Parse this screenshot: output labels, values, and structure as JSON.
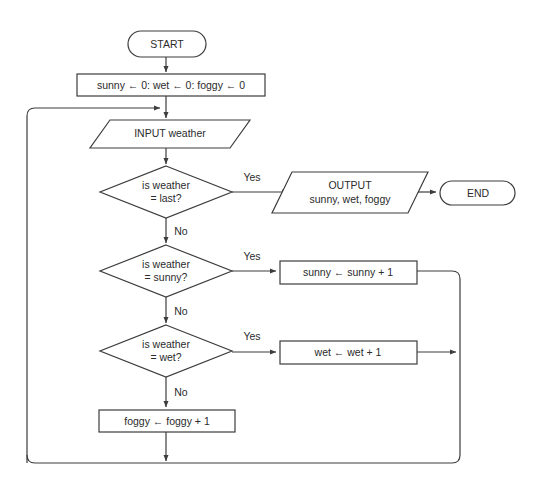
{
  "diagram": {
    "type": "flowchart",
    "colors": {
      "background": "#ffffff",
      "stroke": "#3d3d3d",
      "text": "#2b2b2b",
      "node_fill": "#ffffff"
    },
    "nodes": [
      {
        "id": "start",
        "shape": "terminator",
        "label": "START",
        "x": 128,
        "y": 31,
        "w": 78,
        "h": 26
      },
      {
        "id": "init",
        "shape": "process",
        "label": "sunny ← 0: wet ← 0: foggy ← 0",
        "x": 77,
        "y": 74,
        "w": 188,
        "h": 22
      },
      {
        "id": "input-weather",
        "shape": "parallelogram",
        "label": "INPUT weather",
        "x": 90,
        "y": 120,
        "w": 160,
        "h": 28
      },
      {
        "id": "decision-last",
        "shape": "decision",
        "label_line1": "is weather",
        "label_line2": "= last?",
        "x": 100,
        "y": 166,
        "w": 132,
        "h": 52
      },
      {
        "id": "output-counts",
        "shape": "parallelogram",
        "label_line1": "OUTPUT",
        "label_line2": "sunny, wet, foggy",
        "x": 272,
        "y": 172,
        "w": 156,
        "h": 41
      },
      {
        "id": "end",
        "shape": "terminator",
        "label": "END",
        "x": 440,
        "y": 181,
        "w": 75,
        "h": 24
      },
      {
        "id": "decision-sunny",
        "shape": "decision",
        "label_line1": "is weather",
        "label_line2": "= sunny?",
        "x": 100,
        "y": 245,
        "w": 132,
        "h": 52
      },
      {
        "id": "increment-sunny",
        "shape": "process",
        "label": "sunny ← sunny + 1",
        "x": 280,
        "y": 261,
        "w": 137,
        "h": 23
      },
      {
        "id": "decision-wet",
        "shape": "decision",
        "label_line1": "is weather",
        "label_line2": "= wet?",
        "x": 100,
        "y": 325,
        "w": 132,
        "h": 52
      },
      {
        "id": "increment-wet",
        "shape": "process",
        "label": "wet ← wet + 1",
        "x": 280,
        "y": 341,
        "w": 137,
        "h": 23
      },
      {
        "id": "increment-foggy",
        "shape": "process",
        "label": "foggy ← foggy + 1",
        "x": 99,
        "y": 410,
        "w": 136,
        "h": 22
      }
    ],
    "edge_labels": [
      {
        "id": "yes-last",
        "text": "Yes",
        "x": 252,
        "y": 178
      },
      {
        "id": "no-last",
        "text": "No",
        "x": 181,
        "y": 232
      },
      {
        "id": "yes-sunny",
        "text": "Yes",
        "x": 252,
        "y": 257
      },
      {
        "id": "no-sunny",
        "text": "No",
        "x": 181,
        "y": 312
      },
      {
        "id": "yes-wet",
        "text": "Yes",
        "x": 252,
        "y": 337
      },
      {
        "id": "no-wet",
        "text": "No",
        "x": 181,
        "y": 393
      }
    ],
    "edges": [
      {
        "id": "start-to-init",
        "from": "start",
        "to": "init"
      },
      {
        "id": "init-to-input",
        "from": "init",
        "to": "input-weather"
      },
      {
        "id": "input-to-decision-last",
        "from": "input-weather",
        "to": "decision-last"
      },
      {
        "id": "decision-last-yes",
        "from": "decision-last",
        "to": "output-counts",
        "label": "Yes"
      },
      {
        "id": "output-to-end",
        "from": "output-counts",
        "to": "end"
      },
      {
        "id": "decision-last-no",
        "from": "decision-last",
        "to": "decision-sunny",
        "label": "No"
      },
      {
        "id": "decision-sunny-yes",
        "from": "decision-sunny",
        "to": "increment-sunny",
        "label": "Yes"
      },
      {
        "id": "decision-sunny-no",
        "from": "decision-sunny",
        "to": "decision-wet",
        "label": "No"
      },
      {
        "id": "decision-wet-yes",
        "from": "decision-wet",
        "to": "increment-wet",
        "label": "Yes"
      },
      {
        "id": "decision-wet-no",
        "from": "decision-wet",
        "to": "increment-foggy",
        "label": "No"
      },
      {
        "id": "sunny-to-loop",
        "from": "increment-sunny",
        "to": "loop-return"
      },
      {
        "id": "wet-to-loop",
        "from": "increment-wet",
        "to": "loop-return"
      },
      {
        "id": "foggy-to-loop",
        "from": "increment-foggy",
        "to": "loop-return"
      },
      {
        "id": "loop-return-to-input",
        "from": "loop-return",
        "to": "input-weather"
      }
    ]
  }
}
